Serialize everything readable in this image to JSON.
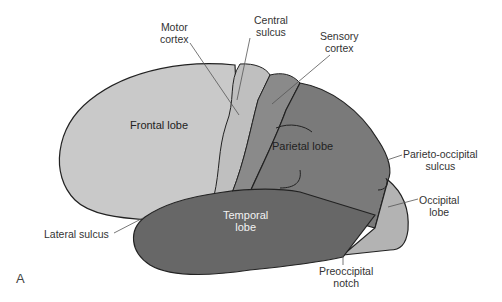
{
  "figure": {
    "panel_label": "A",
    "colors": {
      "frontal": "#c9c9c9",
      "motor": "#bdbdbd",
      "sensory": "#8a8a8a",
      "parietal": "#7a7a7a",
      "temporal": "#676767",
      "occipital": "#b3b3b3",
      "outline": "#222222",
      "leader": "#555555"
    },
    "regions": {
      "frontal": "Frontal lobe",
      "parietal": "Parietal lobe",
      "temporal_line1": "Temporal",
      "temporal_line2": "lobe"
    },
    "callouts": {
      "motor_line1": "Motor",
      "motor_line2": "cortex",
      "central_line1": "Central",
      "central_line2": "sulcus",
      "sensory_line1": "Sensory",
      "sensory_line2": "cortex",
      "parieto_line1": "Parieto-occipital",
      "parieto_line2": "sulcus",
      "occipital_line1": "Occipital",
      "occipital_line2": "lobe",
      "lateral": "Lateral sulcus",
      "preoccipital_line1": "Preoccipital",
      "preoccipital_line2": "notch"
    }
  }
}
